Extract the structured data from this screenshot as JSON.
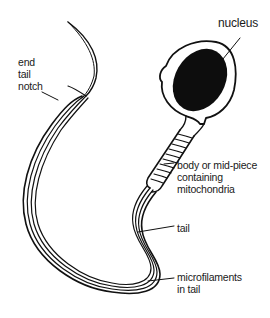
{
  "diagram": {
    "labels": {
      "nucleus": "nucleus",
      "end_tail_notch": [
        "end",
        "tail",
        "notch"
      ],
      "mid_piece": [
        "body or mid-piece",
        "containing",
        "mitochondria"
      ],
      "tail": "tail",
      "microfilaments": [
        "microfilaments",
        "in tail"
      ]
    },
    "colors": {
      "line": "#111111",
      "nucleus_fill": "#0d0d0d",
      "background": "#ffffff"
    }
  }
}
